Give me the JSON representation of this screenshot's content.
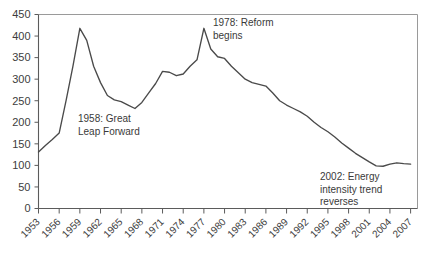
{
  "chart_data": {
    "type": "line",
    "title": "",
    "subtitle": "",
    "xlabel": "",
    "ylabel": "",
    "xlim": [
      1953,
      2008
    ],
    "ylim": [
      0,
      450
    ],
    "grid": false,
    "legend": "none",
    "y_ticks": [
      0,
      50,
      100,
      150,
      200,
      250,
      300,
      350,
      400,
      450
    ],
    "y_tick_labels": [
      "0",
      "50",
      "100",
      "150",
      "200",
      "250",
      "300",
      "350",
      "400",
      "450"
    ],
    "x_ticks": [
      1953,
      1956,
      1959,
      1962,
      1965,
      1968,
      1971,
      1974,
      1977,
      1980,
      1983,
      1986,
      1989,
      1992,
      1995,
      1998,
      2001,
      2004,
      2007
    ],
    "x_tick_labels": [
      "1953",
      "1956",
      "1959",
      "1962",
      "1965",
      "1968",
      "1971",
      "1974",
      "1977",
      "1980",
      "1983",
      "1986",
      "1989",
      "1992",
      "1995",
      "1998",
      "2001",
      "2004",
      "2007"
    ],
    "series": [
      {
        "name": "Energy intensity",
        "color": "#4a4a4a",
        "x": [
          1953,
          1954,
          1955,
          1956,
          1957,
          1958,
          1959,
          1960,
          1961,
          1962,
          1963,
          1964,
          1965,
          1966,
          1967,
          1968,
          1969,
          1970,
          1971,
          1972,
          1973,
          1974,
          1975,
          1976,
          1977,
          1978,
          1979,
          1980,
          1981,
          1982,
          1983,
          1984,
          1985,
          1986,
          1987,
          1988,
          1989,
          1990,
          1991,
          1992,
          1993,
          1994,
          1995,
          1996,
          1997,
          1998,
          1999,
          2000,
          2001,
          2002,
          2003,
          2004,
          2005,
          2006,
          2007
        ],
        "y": [
          131,
          146,
          160,
          175,
          250,
          330,
          418,
          390,
          330,
          292,
          262,
          252,
          248,
          240,
          232,
          246,
          268,
          290,
          318,
          316,
          308,
          312,
          330,
          345,
          418,
          370,
          352,
          348,
          330,
          315,
          300,
          292,
          288,
          284,
          268,
          250,
          240,
          232,
          224,
          214,
          200,
          188,
          178,
          166,
          152,
          140,
          128,
          118,
          108,
          99,
          98,
          103,
          106,
          104,
          103
        ]
      }
    ],
    "annotations": [
      {
        "id": "annot-great-leap-forward",
        "lines": [
          "1958: Great",
          "Leap Forward"
        ],
        "x_px": 78,
        "y_px": 122
      },
      {
        "id": "annot-reform-begins",
        "lines": [
          "1978: Reform",
          "begins"
        ],
        "x_px": 213,
        "y_px": 26
      },
      {
        "id": "annot-energy-intensity-reverses",
        "lines": [
          "2002: Energy",
          "intensity trend",
          "reverses"
        ],
        "x_px": 320,
        "y_px": 180
      }
    ]
  }
}
